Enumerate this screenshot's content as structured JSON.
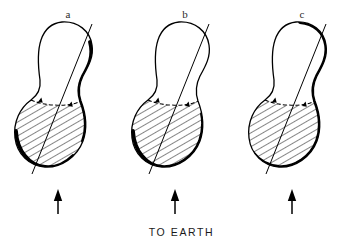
{
  "figure": {
    "caption": "TO EARTH",
    "background_color": "#ffffff",
    "ink_color": "#000000",
    "panels": [
      {
        "id": "a",
        "label": "a",
        "label_x": 68,
        "label_y": 8,
        "body_center_x": 63,
        "arrow_x": 58,
        "description": "pear-shaped contact binary nucleus, rotation axis tilted, lower lobe hatched, terminator shading on upper-right and lower-left limb",
        "shaded_limb": "upper-right-and-lower-left",
        "axis": {
          "x1": 92,
          "y1": 24,
          "x2": 32,
          "y2": 174
        }
      },
      {
        "id": "b",
        "label": "b",
        "label_x": 185,
        "label_y": 8,
        "body_center_x": 180,
        "arrow_x": 175,
        "description": "pear-shaped contact binary nucleus, rotation axis tilted, lower lobe hatched, terminator shading on lower-left limb only",
        "shaded_limb": "lower-left",
        "axis": {
          "x1": 209,
          "y1": 24,
          "x2": 149,
          "y2": 174
        }
      },
      {
        "id": "c",
        "label": "c",
        "label_x": 302,
        "label_y": 8,
        "body_center_x": 297,
        "arrow_x": 292,
        "description": "pear-shaped contact binary nucleus, rotation axis tilted, lower lobe hatched, terminator shading on upper-right and full right limb",
        "shaded_limb": "right",
        "axis": {
          "x1": 326,
          "y1": 24,
          "x2": 266,
          "y2": 174
        }
      }
    ],
    "arrow": {
      "name": "to-earth-direction-arrow",
      "tip_y": 190,
      "tail_y": 214,
      "direction": "up"
    },
    "hatch": {
      "angle_deg": 60,
      "spacing_px": 6,
      "stroke_width": 0.9,
      "region": "lower-lobe-sunlit-hemisphere"
    },
    "outline": {
      "thin_stroke_width": 1.3,
      "thick_stroke_width": 3.6
    }
  }
}
